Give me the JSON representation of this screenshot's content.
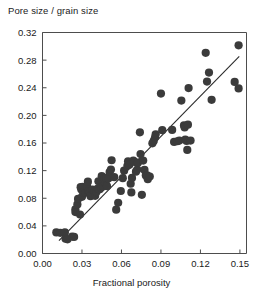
{
  "chart_data": {
    "type": "scatter",
    "title": "Pore size / grain size",
    "xlabel": "Fractional porosity",
    "ylabel": "Pore size / grain size",
    "xlim": [
      0.0,
      0.155
    ],
    "ylim": [
      0.0,
      0.32
    ],
    "xticks": [
      0.0,
      0.03,
      0.06,
      0.09,
      0.12,
      0.15
    ],
    "xtick_labels": [
      "0.00",
      "0.03",
      "0.06",
      "0.09",
      "0.12",
      "0.15"
    ],
    "yticks": [
      0.0,
      0.04,
      0.08,
      0.12,
      0.16,
      0.2,
      0.24,
      0.28,
      0.32
    ],
    "ytick_labels": [
      "0.00",
      "0.04",
      "0.08",
      "0.12",
      "0.16",
      "0.20",
      "0.24",
      "0.28",
      "0.32"
    ],
    "grid": false,
    "legend": null,
    "marker_color": "#3b3b3b",
    "marker_size": 5.4,
    "fit_line": {
      "label": "linear regression",
      "color": "#2b2b2b",
      "x_start": 0.0125,
      "y_start": 0.0185,
      "x_end": 0.1495,
      "y_end": 0.2855
    },
    "points": [
      [
        0.0105,
        0.0305
      ],
      [
        0.0135,
        0.03
      ],
      [
        0.017,
        0.0305
      ],
      [
        0.0175,
        0.0215
      ],
      [
        0.019,
        0.0205
      ],
      [
        0.0225,
        0.0245
      ],
      [
        0.024,
        0.024
      ],
      [
        0.025,
        0.064
      ],
      [
        0.025,
        0.06
      ],
      [
        0.0265,
        0.071
      ],
      [
        0.027,
        0.079
      ],
      [
        0.0285,
        0.0565
      ],
      [
        0.029,
        0.096
      ],
      [
        0.0295,
        0.0925
      ],
      [
        0.03,
        0.082
      ],
      [
        0.0305,
        0.0965
      ],
      [
        0.031,
        0.0885
      ],
      [
        0.0325,
        0.088
      ],
      [
        0.034,
        0.0965
      ],
      [
        0.0345,
        0.104
      ],
      [
        0.035,
        0.09
      ],
      [
        0.036,
        0.0885
      ],
      [
        0.0365,
        0.083
      ],
      [
        0.038,
        0.0925
      ],
      [
        0.0395,
        0.09
      ],
      [
        0.04,
        0.0835
      ],
      [
        0.041,
        0.089
      ],
      [
        0.042,
        0.094
      ],
      [
        0.0425,
        0.1045
      ],
      [
        0.0435,
        0.093
      ],
      [
        0.0445,
        0.0955
      ],
      [
        0.045,
        0.112
      ],
      [
        0.046,
        0.097
      ],
      [
        0.047,
        0.1085
      ],
      [
        0.048,
        0.101
      ],
      [
        0.0485,
        0.1095
      ],
      [
        0.049,
        0.0975
      ],
      [
        0.05,
        0.1085
      ],
      [
        0.051,
        0.118
      ],
      [
        0.052,
        0.1215
      ],
      [
        0.0525,
        0.135
      ],
      [
        0.0545,
        0.1105
      ],
      [
        0.056,
        0.0635
      ],
      [
        0.0575,
        0.0735
      ],
      [
        0.0595,
        0.0905
      ],
      [
        0.061,
        0.109
      ],
      [
        0.062,
        0.12
      ],
      [
        0.0645,
        0.127
      ],
      [
        0.065,
        0.1335
      ],
      [
        0.066,
        0.1285
      ],
      [
        0.067,
        0.101
      ],
      [
        0.0675,
        0.0885
      ],
      [
        0.068,
        0.1095
      ],
      [
        0.069,
        0.1345
      ],
      [
        0.07,
        0.1325
      ],
      [
        0.071,
        0.1185
      ],
      [
        0.072,
        0.1215
      ],
      [
        0.0725,
        0.1315
      ],
      [
        0.074,
        0.1755
      ],
      [
        0.0745,
        0.144
      ],
      [
        0.0755,
        0.085
      ],
      [
        0.0765,
        0.1345
      ],
      [
        0.0775,
        0.121
      ],
      [
        0.0785,
        0.113
      ],
      [
        0.0795,
        0.113
      ],
      [
        0.08,
        0.1075
      ],
      [
        0.0815,
        0.1115
      ],
      [
        0.0835,
        0.1595
      ],
      [
        0.0845,
        0.163
      ],
      [
        0.0855,
        0.168
      ],
      [
        0.086,
        0.1725
      ],
      [
        0.09,
        0.2315
      ],
      [
        0.091,
        0.1785
      ],
      [
        0.0985,
        0.179
      ],
      [
        0.1,
        0.1615
      ],
      [
        0.1025,
        0.1625
      ],
      [
        0.104,
        0.1635
      ],
      [
        0.1055,
        0.2215
      ],
      [
        0.1075,
        0.1855
      ],
      [
        0.108,
        0.1825
      ],
      [
        0.1085,
        0.165
      ],
      [
        0.1095,
        0.163
      ],
      [
        0.11,
        0.15
      ],
      [
        0.1105,
        0.1865
      ],
      [
        0.111,
        0.2395
      ],
      [
        0.1125,
        0.1635
      ],
      [
        0.124,
        0.2905
      ],
      [
        0.125,
        0.249
      ],
      [
        0.1265,
        0.262
      ],
      [
        0.1285,
        0.2225
      ],
      [
        0.146,
        0.2485
      ],
      [
        0.149,
        0.3015
      ],
      [
        0.149,
        0.239
      ]
    ]
  }
}
